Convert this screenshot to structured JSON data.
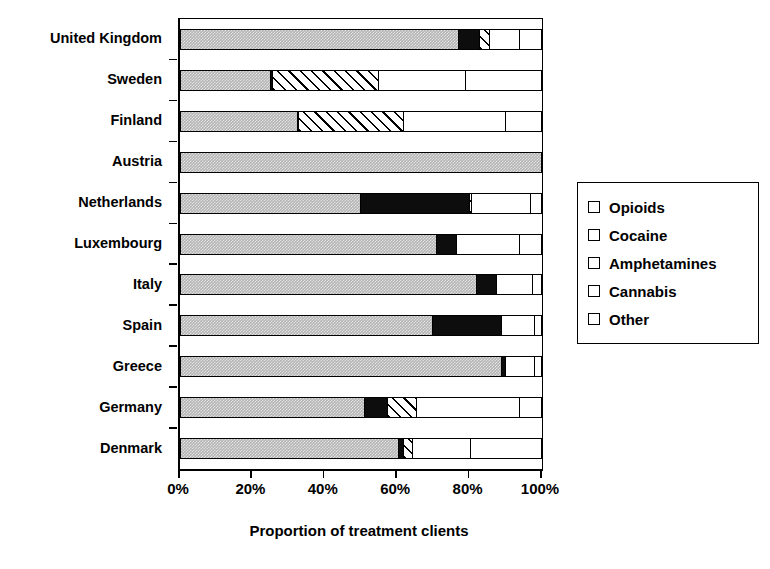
{
  "chart_data": {
    "type": "bar",
    "orientation": "horizontal",
    "stacked": true,
    "title": "",
    "xlabel": "Proportion of treatment clients",
    "ylabel": "",
    "xlim": [
      0,
      100
    ],
    "grid": false,
    "legend_position": "right",
    "xtick_labels": [
      "0%",
      "20%",
      "40%",
      "60%",
      "80%",
      "100%"
    ],
    "xtick_values": [
      0,
      20,
      40,
      60,
      80,
      100
    ],
    "categories": [
      "United Kingdom",
      "Sweden",
      "Finland",
      "Austria",
      "Netherlands",
      "Luxembourg",
      "Italy",
      "Spain",
      "Greece",
      "Germany",
      "Denmark"
    ],
    "series": [
      {
        "name": "Opioids",
        "color": "#b4b4b4",
        "pattern": "stipple-gray",
        "values": [
          77,
          25,
          32.5,
          100,
          50,
          71,
          82,
          70,
          89,
          51,
          60.5
        ]
      },
      {
        "name": "Cocaine",
        "color": "#0d0d0d",
        "pattern": "solid-black",
        "values": [
          6,
          0.8,
          0.5,
          0,
          30,
          5.5,
          5.5,
          19,
          1,
          6.5,
          1.5
        ]
      },
      {
        "name": "Amphetamines",
        "color": "#ffffff",
        "pattern": "diagonal-hatch",
        "values": [
          2.5,
          29.2,
          29,
          0,
          0.7,
          0,
          0,
          0,
          0,
          8,
          2.5
        ]
      },
      {
        "name": "Cannabis",
        "color": "#ffffff",
        "pattern": "plain-white",
        "values": [
          8.5,
          24,
          28,
          0,
          16.3,
          17.5,
          10,
          9,
          8,
          28.5,
          16
        ]
      },
      {
        "name": "Other",
        "color": "#ffffff",
        "pattern": "stipple-dots",
        "values": [
          6,
          21,
          10,
          0,
          3,
          6,
          2.5,
          2,
          2,
          6,
          19.5
        ]
      }
    ]
  },
  "legend": {
    "items": [
      {
        "label": "Opioids"
      },
      {
        "label": "Cocaine"
      },
      {
        "label": "Amphetamines"
      },
      {
        "label": "Cannabis"
      },
      {
        "label": "Other"
      }
    ]
  }
}
